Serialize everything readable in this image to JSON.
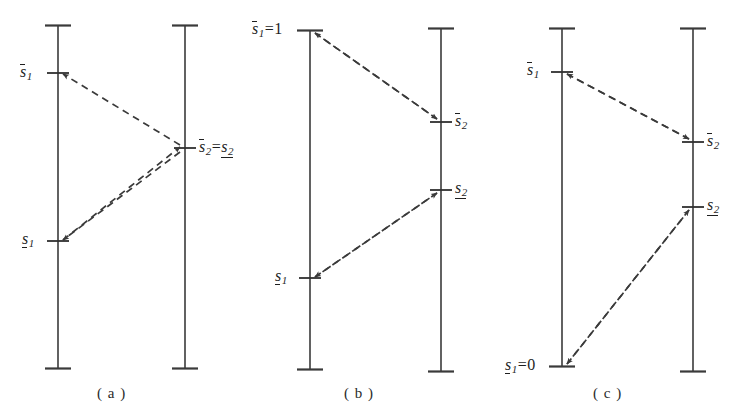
{
  "figure": {
    "background_color": "#ffffff",
    "ink_color": "#3a3a3a",
    "panels": [
      {
        "id": "a",
        "caption": "( a )",
        "caption_x": 96,
        "caption_y": 386,
        "left_axis": {
          "x": 58,
          "y_top": 25,
          "y_bottom": 369,
          "cap_half_width": 13
        },
        "right_axis": {
          "x": 185,
          "y_top": 25,
          "y_bottom": 369,
          "cap_half_width": 13
        },
        "marks": [
          {
            "name": "s1-upper",
            "axis": "left",
            "y": 73,
            "label_html": "s-overbar-1",
            "label_side": "left",
            "label_x": 20,
            "label_y": 63
          },
          {
            "name": "s1-lower",
            "axis": "left",
            "y": 241,
            "label_html": "s-underbar-1",
            "label_side": "left",
            "label_x": 22,
            "label_y": 231
          },
          {
            "name": "s2-both",
            "axis": "right",
            "y": 148,
            "label_html": "s2-over-eq-under",
            "label_side": "right",
            "label_x": 196,
            "label_y": 138
          }
        ],
        "links": [
          {
            "from": [
              58,
              73
            ],
            "to": [
              185,
              148
            ]
          },
          {
            "from": [
              58,
              241
            ],
            "to": [
              185,
              148
            ]
          }
        ],
        "arrow_targets": [
          [
            58,
            73
          ],
          [
            58,
            241
          ],
          [
            185,
            148
          ]
        ]
      },
      {
        "id": "b",
        "caption": "( b )",
        "caption_x": 343,
        "caption_y": 386,
        "left_axis": {
          "x": 310,
          "y_top": 30,
          "y_bottom": 370,
          "cap_half_width": 13
        },
        "right_axis": {
          "x": 441,
          "y_top": 28,
          "y_bottom": 372,
          "cap_half_width": 13
        },
        "marks": [
          {
            "name": "s1-upper",
            "axis": "left",
            "y": 31,
            "label_html": "s-overbar-1-eq-1",
            "label_side": "left",
            "label_x": 252,
            "label_y": 21
          },
          {
            "name": "s1-lower",
            "axis": "left",
            "y": 278,
            "label_html": "s-underbar-1",
            "label_side": "left",
            "label_x": 275,
            "label_y": 268
          },
          {
            "name": "s2-upper",
            "axis": "right",
            "y": 122,
            "label_html": "s-overbar-2",
            "label_side": "right",
            "label_x": 452,
            "label_y": 112
          },
          {
            "name": "s2-lower",
            "axis": "right",
            "y": 190,
            "label_html": "s-underbar-2",
            "label_side": "right",
            "label_x": 452,
            "label_y": 180
          }
        ],
        "links": [
          {
            "from": [
              310,
              31
            ],
            "to": [
              441,
              122
            ]
          },
          {
            "from": [
              310,
              278
            ],
            "to": [
              441,
              190
            ]
          }
        ],
        "arrow_targets": [
          [
            310,
            31
          ],
          [
            310,
            278
          ],
          [
            441,
            122
          ],
          [
            441,
            190
          ]
        ]
      },
      {
        "id": "c",
        "caption": "( c )",
        "caption_x": 592,
        "caption_y": 386,
        "left_axis": {
          "x": 562,
          "y_top": 28,
          "y_bottom": 367,
          "cap_half_width": 13
        },
        "right_axis": {
          "x": 693,
          "y_top": 28,
          "y_bottom": 372,
          "cap_half_width": 13
        },
        "marks": [
          {
            "name": "s1-upper",
            "axis": "left",
            "y": 72,
            "label_html": "s-overbar-1",
            "label_side": "left",
            "label_x": 525,
            "label_y": 62
          },
          {
            "name": "s1-lower",
            "axis": "left",
            "y": 367,
            "label_html": "s-underbar-1-eq-0",
            "label_side": "left",
            "label_x": 505,
            "label_y": 357
          },
          {
            "name": "s2-upper",
            "axis": "right",
            "y": 142,
            "label_html": "s-overbar-2",
            "label_side": "right",
            "label_x": 704,
            "label_y": 132
          },
          {
            "name": "s2-lower",
            "axis": "right",
            "y": 207,
            "label_html": "s-underbar-2",
            "label_side": "right",
            "label_x": 704,
            "label_y": 197
          }
        ],
        "links": [
          {
            "from": [
              562,
              72
            ],
            "to": [
              693,
              142
            ]
          },
          {
            "from": [
              562,
              367
            ],
            "to": [
              693,
              207
            ]
          }
        ],
        "arrow_targets": [
          [
            562,
            72
          ],
          [
            562,
            367
          ],
          [
            693,
            142
          ],
          [
            693,
            207
          ]
        ]
      }
    ],
    "labels": {
      "s_overbar_1": "s̄1",
      "s_underbar_1": "s1 (underbar)",
      "s_overbar_2": "s̄2",
      "s_underbar_2": "s2 (underbar)",
      "s_overbar_1_eq_1": "s̄1=1",
      "s_underbar_1_eq_0": "s1=0 (underbar)",
      "s2_over_eq_under": "s̄2=s2 (underbar)",
      "variable_letter": "s",
      "subscript_1": "1",
      "subscript_2": "2",
      "equals": "=",
      "value_one": "1",
      "value_zero": "0"
    },
    "captions": {
      "panel_a": "( a )",
      "panel_b": "( b )",
      "panel_c": "( c )"
    }
  }
}
